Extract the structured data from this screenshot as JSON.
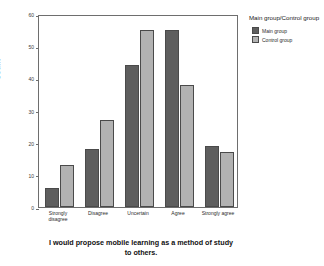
{
  "chart_data": {
    "type": "bar",
    "title": "I would propose mobile learning as a method of study to others.",
    "xlabel": "",
    "ylabel": "Count",
    "ylim": [
      0,
      60
    ],
    "yticks": [
      0,
      10,
      20,
      30,
      40,
      50,
      60
    ],
    "ytick_labels": [
      "0",
      "10",
      "20",
      "30",
      "40",
      "50",
      "60"
    ],
    "grid": false,
    "legend_position": "right",
    "legend_title": "Main group/Control group",
    "categories": [
      "Strongly disagree",
      "Disagree",
      "Uncertain",
      "Agree",
      "Strongly agree"
    ],
    "series": [
      {
        "name": "Main group",
        "color": "#5e5e5e",
        "values": [
          6,
          18,
          44,
          55,
          19
        ]
      },
      {
        "name": "Control group",
        "color": "#b2b2b2",
        "values": [
          13,
          27,
          55,
          38,
          17
        ]
      }
    ]
  },
  "axis": {
    "y_title": "Count",
    "ticks": [
      {
        "value": 60,
        "label": "60"
      },
      {
        "value": 50,
        "label": "50"
      },
      {
        "value": 40,
        "label": "40"
      },
      {
        "value": 30,
        "label": "30"
      },
      {
        "value": 20,
        "label": "20"
      },
      {
        "value": 10,
        "label": "10"
      },
      {
        "value": 0,
        "label": "0"
      }
    ]
  },
  "x_categories": [
    {
      "line1": "Strongly",
      "line2": "disagree"
    },
    {
      "line1": "Disagree",
      "line2": ""
    },
    {
      "line1": "Uncertain",
      "line2": ""
    },
    {
      "line1": "Agree",
      "line2": ""
    },
    {
      "line1": "Strongly agree",
      "line2": ""
    }
  ],
  "legend": {
    "title": "Main group/Control group",
    "items": [
      {
        "label": "Main group",
        "color": "#5e5e5e"
      },
      {
        "label": "Control group",
        "color": "#b2b2b2"
      }
    ]
  },
  "title": {
    "line1": "I would propose mobile learning as a method of study",
    "line2": "to others."
  }
}
